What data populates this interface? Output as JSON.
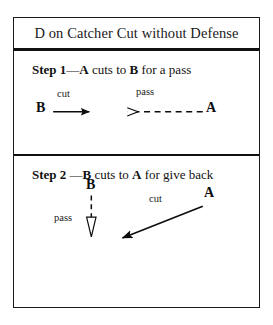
{
  "diagram": {
    "title": "D on Catcher Cut without Defense",
    "colors": {
      "ink": "#111111",
      "frame": "#1a1a1a",
      "background": "#ffffff"
    },
    "steps": [
      {
        "id": "step-1",
        "heading_prefix": "Step 1",
        "heading_dash": "—",
        "heading_actor": "A",
        "heading_mid": " cuts to ",
        "heading_target": "B",
        "heading_suffix": " for a pass",
        "heading_plain": "Step 1—A cuts to B for a pass",
        "players": [
          {
            "name": "player-b",
            "label": "B"
          },
          {
            "name": "player-a",
            "label": "A"
          }
        ],
        "movements": [
          {
            "name": "cut-arrow",
            "label": "cut",
            "style": "solid",
            "head": "filled",
            "direction": "right"
          },
          {
            "name": "pass-arrow",
            "label": "pass",
            "style": "dashed",
            "head": "hollow",
            "direction": "left"
          }
        ]
      },
      {
        "id": "step-2",
        "heading_prefix": "Step 2",
        "heading_dash": " —",
        "heading_actor": "B",
        "heading_mid": " cuts to ",
        "heading_target": "A",
        "heading_suffix": " for give back",
        "heading_plain": "Step 2 —B cuts to A for give back",
        "players": [
          {
            "name": "player-b",
            "label": "B"
          },
          {
            "name": "player-a",
            "label": "A"
          }
        ],
        "movements": [
          {
            "name": "pass-arrow",
            "label": "pass",
            "style": "dashed",
            "head": "hollow",
            "direction": "down"
          },
          {
            "name": "cut-arrow",
            "label": "cut",
            "style": "solid",
            "head": "filled",
            "direction": "down-left"
          }
        ]
      }
    ]
  }
}
